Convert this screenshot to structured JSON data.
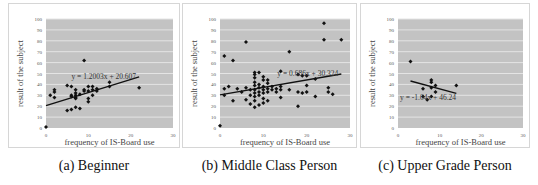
{
  "chart_data": [
    {
      "type": "scatter",
      "title": "",
      "caption": "(a) Beginner",
      "xlabel": "frequency of IS-Board use",
      "ylabel": "result of the subject",
      "xlim": [
        0,
        30
      ],
      "ylim": [
        0,
        100
      ],
      "xticks": [
        0,
        10,
        20,
        30
      ],
      "yticks": [
        0,
        10,
        20,
        30,
        40,
        50,
        60,
        70,
        80,
        90,
        100
      ],
      "grid": true,
      "trendline": {
        "slope": 1.2003,
        "intercept": 20.607,
        "label": "y = 1.2003x + 20.607",
        "x_range": [
          0,
          22
        ]
      },
      "points": [
        [
          0,
          1
        ],
        [
          1,
          30
        ],
        [
          2,
          28
        ],
        [
          2,
          33
        ],
        [
          2,
          35
        ],
        [
          5,
          39
        ],
        [
          5,
          16
        ],
        [
          6,
          38
        ],
        [
          6,
          17
        ],
        [
          6,
          30
        ],
        [
          6,
          29
        ],
        [
          7,
          35
        ],
        [
          7,
          32
        ],
        [
          7,
          30
        ],
        [
          7,
          28
        ],
        [
          7,
          27
        ],
        [
          7,
          19
        ],
        [
          8,
          31
        ],
        [
          8,
          18
        ],
        [
          9,
          62
        ],
        [
          9,
          35
        ],
        [
          9,
          34
        ],
        [
          10,
          38
        ],
        [
          10,
          34
        ],
        [
          10,
          27
        ],
        [
          10,
          24
        ],
        [
          11,
          38
        ],
        [
          11,
          35
        ],
        [
          11,
          30
        ],
        [
          12,
          36
        ],
        [
          12,
          34
        ],
        [
          15,
          42
        ],
        [
          15,
          38
        ],
        [
          22,
          37
        ]
      ]
    },
    {
      "type": "scatter",
      "title": "",
      "caption": "(b) Middle Class Person",
      "xlabel": "frequency of IS-Board use",
      "ylabel": "result of the subject",
      "xlim": [
        0,
        30
      ],
      "ylim": [
        0,
        100
      ],
      "xticks": [
        0,
        10,
        20,
        30
      ],
      "yticks": [
        0,
        10,
        20,
        30,
        40,
        50,
        60,
        70,
        80,
        90,
        100
      ],
      "grid": true,
      "trendline": {
        "slope": 0.686,
        "intercept": 30.324,
        "label": "y = 0.686x + 30.324",
        "x_range": [
          0,
          28
        ]
      },
      "points": [
        [
          0,
          2
        ],
        [
          1,
          66
        ],
        [
          1,
          36
        ],
        [
          1,
          30
        ],
        [
          2,
          38
        ],
        [
          3,
          62
        ],
        [
          3,
          25
        ],
        [
          4,
          36
        ],
        [
          5,
          33
        ],
        [
          6,
          79
        ],
        [
          6,
          37
        ],
        [
          6,
          26
        ],
        [
          7,
          35
        ],
        [
          7,
          30
        ],
        [
          7,
          22
        ],
        [
          8,
          51
        ],
        [
          8,
          49
        ],
        [
          8,
          46
        ],
        [
          8,
          42
        ],
        [
          8,
          39
        ],
        [
          8,
          35
        ],
        [
          8,
          32
        ],
        [
          8,
          29
        ],
        [
          8,
          25
        ],
        [
          8,
          19
        ],
        [
          9,
          51
        ],
        [
          9,
          40
        ],
        [
          9,
          37
        ],
        [
          9,
          33
        ],
        [
          9,
          30
        ],
        [
          9,
          21
        ],
        [
          10,
          47
        ],
        [
          10,
          44
        ],
        [
          10,
          38
        ],
        [
          10,
          35
        ],
        [
          10,
          32
        ],
        [
          10,
          27
        ],
        [
          10,
          23
        ],
        [
          11,
          44
        ],
        [
          11,
          41
        ],
        [
          11,
          36
        ],
        [
          11,
          33
        ],
        [
          11,
          25
        ],
        [
          12,
          38
        ],
        [
          12,
          35
        ],
        [
          13,
          36
        ],
        [
          13,
          33
        ],
        [
          14,
          52
        ],
        [
          14,
          38
        ],
        [
          14,
          35
        ],
        [
          14,
          28
        ],
        [
          16,
          70
        ],
        [
          16,
          35
        ],
        [
          18,
          49
        ],
        [
          18,
          33
        ],
        [
          18,
          20
        ],
        [
          19,
          32
        ],
        [
          19,
          48
        ],
        [
          20,
          48
        ],
        [
          20,
          39
        ],
        [
          20,
          33
        ],
        [
          22,
          45
        ],
        [
          22,
          29
        ],
        [
          24,
          96
        ],
        [
          24,
          81
        ],
        [
          25,
          37
        ],
        [
          25,
          33
        ],
        [
          26,
          31
        ],
        [
          28,
          81
        ]
      ]
    },
    {
      "type": "scatter",
      "title": "",
      "caption": "(c) Upper Grade Person",
      "xlabel": "frequency of IS-Board use",
      "ylabel": "result of the subject",
      "xlim": [
        0,
        30
      ],
      "ylim": [
        0,
        100
      ],
      "xticks": [
        0,
        10,
        20,
        30
      ],
      "yticks": [
        0,
        10,
        20,
        30,
        40,
        50,
        60,
        70,
        80,
        90,
        100
      ],
      "grid": true,
      "trendline": {
        "slope": -1.04,
        "intercept": 46.24,
        "label": "y = -1.04x + 46.24",
        "x_range": [
          3,
          14
        ]
      },
      "points": [
        [
          3,
          61
        ],
        [
          6,
          36
        ],
        [
          6,
          29
        ],
        [
          7,
          26
        ],
        [
          8,
          44
        ],
        [
          8,
          42
        ],
        [
          8,
          37
        ],
        [
          8,
          29
        ],
        [
          9,
          39
        ],
        [
          9,
          33
        ],
        [
          14,
          39
        ]
      ]
    }
  ],
  "panels": [
    {
      "caption": "(a) Beginner"
    },
    {
      "caption": "(b) Middle Class Person"
    },
    {
      "caption": "(c) Upper Grade Person"
    }
  ],
  "colors": {
    "plot_bg": "#c3c3c3",
    "grid": "#e4e4e4",
    "point": "#111111",
    "line": "#111111",
    "tick_text": "#555555",
    "label_text": "#444444"
  }
}
